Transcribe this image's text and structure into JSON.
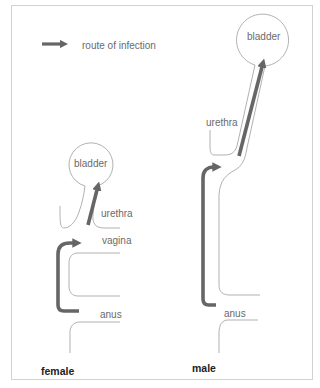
{
  "legend": {
    "arrow_icon": "route-arrow-icon",
    "label": "route of infection"
  },
  "female": {
    "title": "female",
    "labels": {
      "bladder": "bladder",
      "urethra": "urethra",
      "vagina": "vagina",
      "anus": "anus"
    }
  },
  "male": {
    "title": "male",
    "labels": {
      "bladder": "bladder",
      "urethra": "urethra",
      "anus": "anus"
    }
  },
  "colors": {
    "arrow": "#666666",
    "outline": "#a8a8a8",
    "label": "#6a6a6a",
    "frame": "#d2d2d2"
  }
}
